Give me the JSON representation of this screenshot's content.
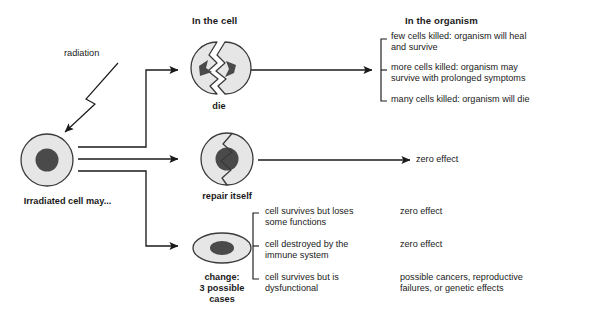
{
  "diagram": {
    "title_in_cell": "In the cell",
    "title_in_organism": "In the organism",
    "radiation_label": "radiation",
    "source_cell_label": "Irradiated cell may...",
    "outcomes": [
      {
        "cell_label": "die",
        "cell_icon": "split-cell-icon",
        "consequences": [
          "few cells killed: organism will heal\nand survive",
          "more cells killed: organism may\nsurvive with prolonged symptoms",
          "many cells killed: organism will die"
        ]
      },
      {
        "cell_label": "repair itself",
        "cell_icon": "cracked-cell-icon",
        "consequences": [
          "zero effect"
        ]
      },
      {
        "cell_label": "change:\n3 possible\ncases",
        "cell_icon": "mutated-cell-icon",
        "cases": [
          {
            "description": "cell survives but loses\nsome functions",
            "effect": "zero effect"
          },
          {
            "description": "cell destroyed by the\nimmune system",
            "effect": "zero effect"
          },
          {
            "description": "cell survives but is\ndysfunctional",
            "effect": "possible cancers, reproductive\nfailures, or genetic effects"
          }
        ]
      }
    ]
  },
  "colors": {
    "line": "#1a1a1a",
    "cell_fill": "#e6e6e6",
    "cell_stroke": "#3a3a3a",
    "nucleus_fill": "#4a4a4a",
    "text": "#1a1a1a",
    "background": "#ffffff"
  }
}
